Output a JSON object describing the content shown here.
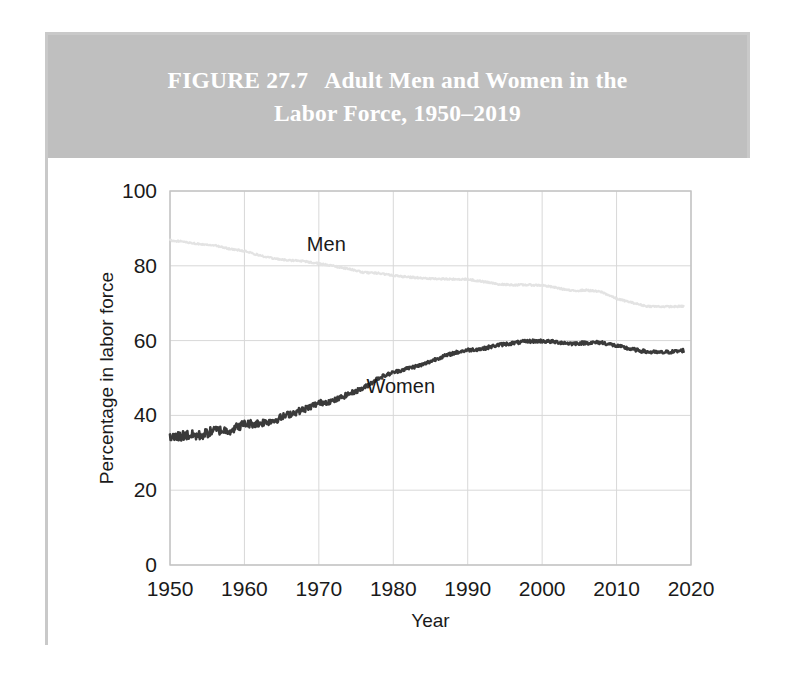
{
  "figure": {
    "label": "FIGURE 27.7",
    "title_line1": "Adult Men and Women in the",
    "title_line2": "Labor Force, 1950–2019",
    "title_full": "FIGURE 27.7   Adult Men and Women in the Labor Force, 1950–2019",
    "banner_color": "#bfbfbf",
    "banner_text_color": "#ffffff",
    "frame_color": "#c9c9c9"
  },
  "chart_data": {
    "type": "line",
    "title": "Adult Men and Women in the Labor Force, 1950–2019",
    "xlabel": "Year",
    "ylabel": "Percentage in labor force",
    "xlim": [
      1950,
      2020
    ],
    "ylim": [
      0,
      100
    ],
    "xticks": [
      1950,
      1960,
      1970,
      1980,
      1990,
      2000,
      2010,
      2020
    ],
    "yticks": [
      0,
      20,
      40,
      60,
      80,
      100
    ],
    "grid": true,
    "legend": "inline-annotations",
    "annotations": [
      {
        "text": "Men",
        "x": 1971,
        "y": 84,
        "color": "#1a1a1a"
      },
      {
        "text": "Women",
        "x": 1981,
        "y": 46,
        "color": "#1a1a1a"
      }
    ],
    "x": [
      1950,
      1952,
      1954,
      1956,
      1958,
      1960,
      1962,
      1964,
      1966,
      1968,
      1970,
      1972,
      1974,
      1976,
      1978,
      1980,
      1982,
      1984,
      1986,
      1988,
      1990,
      1992,
      1994,
      1996,
      1998,
      2000,
      2002,
      2004,
      2006,
      2008,
      2010,
      2012,
      2014,
      2016,
      2018,
      2019
    ],
    "series": [
      {
        "name": "Men",
        "color": "#e3e3e3",
        "values": [
          86.8,
          86.4,
          85.8,
          85.5,
          84.5,
          84.0,
          82.8,
          81.9,
          81.5,
          81.2,
          80.6,
          79.9,
          79.2,
          78.2,
          78.0,
          77.4,
          77.0,
          76.7,
          76.5,
          76.4,
          76.4,
          75.8,
          75.1,
          74.9,
          74.9,
          74.8,
          74.1,
          73.3,
          73.5,
          73.0,
          71.2,
          70.2,
          69.2,
          69.1,
          69.1,
          69.2
        ]
      },
      {
        "name": "Women",
        "color": "#3a3a3a",
        "values": [
          33.9,
          34.7,
          34.6,
          36.0,
          36.0,
          37.7,
          37.9,
          38.7,
          40.3,
          41.6,
          43.3,
          43.9,
          45.7,
          47.3,
          50.0,
          51.5,
          52.6,
          53.6,
          55.3,
          56.6,
          57.5,
          57.8,
          58.8,
          59.3,
          59.8,
          59.9,
          59.6,
          59.2,
          59.4,
          59.5,
          58.6,
          57.7,
          57.0,
          56.8,
          57.1,
          57.4
        ]
      }
    ],
    "noise": {
      "description": "monthly-frequency jitter overlaid on annual trend; amplitude larger for Women pre-1980",
      "seed": 27
    }
  },
  "plot_geometry": {
    "left": 167,
    "right": 688,
    "top": 188,
    "bottom": 562
  }
}
